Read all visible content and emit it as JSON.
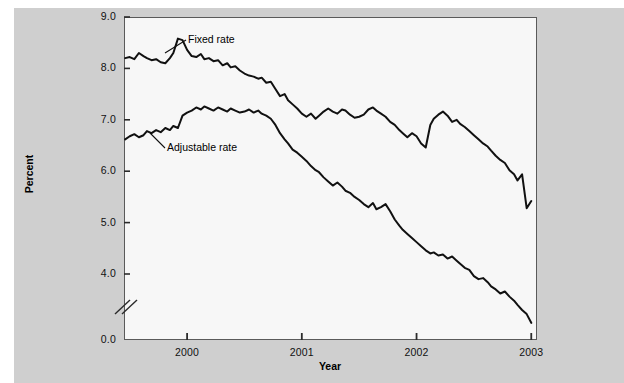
{
  "chart_data": {
    "type": "line",
    "title": "",
    "xlabel": "Year",
    "ylabel": "Percent",
    "grid": false,
    "legend_position": "inline-annotations",
    "xlim": [
      1999.45,
      2003.05
    ],
    "ylim": [
      3.85,
      9.0
    ],
    "y_axis_break": true,
    "y_axis_break_note": "axis broken between 4.0 and 0.0",
    "yticks": [
      "0.0",
      "4.0",
      "5.0",
      "6.0",
      "7.0",
      "8.0",
      "9.0"
    ],
    "ytick_values": [
      0.0,
      4.0,
      5.0,
      6.0,
      7.0,
      8.0,
      9.0
    ],
    "xticks": [
      "2000",
      "2001",
      "2002",
      "2003"
    ],
    "xtick_values": [
      2000,
      2001,
      2002,
      2003
    ],
    "annotations": [
      {
        "text": "Fixed rate",
        "x": 2000.08,
        "y": 8.72
      },
      {
        "text": "Adjustable rate",
        "x": 1999.95,
        "y": 6.56
      }
    ],
    "series": [
      {
        "name": "Fixed rate",
        "color": "#111111",
        "x": [
          1999.46,
          1999.5,
          1999.54,
          1999.58,
          1999.62,
          1999.65,
          1999.69,
          1999.73,
          1999.77,
          1999.81,
          1999.85,
          1999.88,
          1999.92,
          1999.96,
          2000.0,
          2000.04,
          2000.08,
          2000.12,
          2000.15,
          2000.19,
          2000.23,
          2000.27,
          2000.31,
          2000.35,
          2000.38,
          2000.42,
          2000.46,
          2000.5,
          2000.54,
          2000.58,
          2000.62,
          2000.65,
          2000.69,
          2000.73,
          2000.77,
          2000.81,
          2000.85,
          2000.88,
          2000.92,
          2000.96,
          2001.0,
          2001.04,
          2001.08,
          2001.12,
          2001.15,
          2001.19,
          2001.23,
          2001.27,
          2001.31,
          2001.35,
          2001.38,
          2001.42,
          2001.46,
          2001.5,
          2001.54,
          2001.58,
          2001.62,
          2001.65,
          2001.69,
          2001.73,
          2001.77,
          2001.81,
          2001.85,
          2001.88,
          2001.92,
          2001.96,
          2002.0,
          2002.04,
          2002.08,
          2002.12,
          2002.15,
          2002.19,
          2002.23,
          2002.27,
          2002.31,
          2002.35,
          2002.38,
          2002.42,
          2002.46,
          2002.5,
          2002.54,
          2002.58,
          2002.62,
          2002.65,
          2002.69,
          2002.73,
          2002.77,
          2002.81,
          2002.85,
          2002.88,
          2002.92,
          2002.96,
          2003.0
        ],
        "y": [
          8.2,
          8.22,
          8.18,
          8.3,
          8.24,
          8.2,
          8.16,
          8.18,
          8.12,
          8.1,
          8.2,
          8.3,
          8.58,
          8.55,
          8.36,
          8.24,
          8.22,
          8.28,
          8.18,
          8.2,
          8.14,
          8.16,
          8.06,
          8.1,
          8.02,
          8.04,
          7.96,
          7.9,
          7.86,
          7.84,
          7.8,
          7.82,
          7.72,
          7.74,
          7.6,
          7.46,
          7.5,
          7.38,
          7.3,
          7.22,
          7.12,
          7.06,
          7.12,
          7.02,
          7.08,
          7.16,
          7.22,
          7.16,
          7.12,
          7.2,
          7.18,
          7.1,
          7.04,
          7.06,
          7.1,
          7.2,
          7.24,
          7.18,
          7.12,
          7.06,
          6.96,
          6.9,
          6.8,
          6.74,
          6.66,
          6.74,
          6.68,
          6.54,
          6.46,
          6.9,
          7.02,
          7.1,
          7.16,
          7.08,
          6.96,
          7.0,
          6.92,
          6.86,
          6.78,
          6.7,
          6.62,
          6.54,
          6.48,
          6.4,
          6.3,
          6.22,
          6.16,
          6.02,
          5.94,
          5.82,
          5.94,
          5.28,
          5.42
        ]
      },
      {
        "name": "Adjustable rate",
        "color": "#111111",
        "x": [
          1999.46,
          1999.5,
          1999.54,
          1999.58,
          1999.62,
          1999.65,
          1999.69,
          1999.73,
          1999.77,
          1999.81,
          1999.85,
          1999.88,
          1999.92,
          1999.96,
          2000.0,
          2000.04,
          2000.08,
          2000.12,
          2000.15,
          2000.19,
          2000.23,
          2000.27,
          2000.31,
          2000.35,
          2000.38,
          2000.42,
          2000.46,
          2000.5,
          2000.54,
          2000.58,
          2000.62,
          2000.65,
          2000.69,
          2000.73,
          2000.77,
          2000.81,
          2000.85,
          2000.88,
          2000.92,
          2000.96,
          2001.0,
          2001.04,
          2001.08,
          2001.12,
          2001.15,
          2001.19,
          2001.23,
          2001.27,
          2001.31,
          2001.35,
          2001.38,
          2001.42,
          2001.46,
          2001.5,
          2001.54,
          2001.58,
          2001.62,
          2001.65,
          2001.69,
          2001.73,
          2001.77,
          2001.81,
          2001.85,
          2001.88,
          2001.92,
          2001.96,
          2002.0,
          2002.04,
          2002.08,
          2002.12,
          2002.15,
          2002.19,
          2002.23,
          2002.27,
          2002.31,
          2002.35,
          2002.38,
          2002.42,
          2002.46,
          2002.5,
          2002.54,
          2002.58,
          2002.62,
          2002.65,
          2002.69,
          2002.73,
          2002.77,
          2002.81,
          2002.85,
          2002.88,
          2002.92,
          2002.96,
          2003.0
        ],
        "y": [
          6.62,
          6.68,
          6.72,
          6.66,
          6.7,
          6.78,
          6.74,
          6.8,
          6.76,
          6.84,
          6.8,
          6.88,
          6.84,
          7.08,
          7.14,
          7.18,
          7.24,
          7.2,
          7.26,
          7.22,
          7.18,
          7.24,
          7.2,
          7.16,
          7.22,
          7.18,
          7.14,
          7.16,
          7.2,
          7.14,
          7.18,
          7.12,
          7.08,
          7.02,
          6.9,
          6.74,
          6.62,
          6.54,
          6.42,
          6.36,
          6.28,
          6.2,
          6.1,
          6.02,
          5.98,
          5.88,
          5.8,
          5.72,
          5.78,
          5.7,
          5.62,
          5.58,
          5.5,
          5.44,
          5.36,
          5.3,
          5.38,
          5.26,
          5.3,
          5.36,
          5.22,
          5.06,
          4.94,
          4.86,
          4.78,
          4.7,
          4.62,
          4.54,
          4.46,
          4.4,
          4.42,
          4.36,
          4.38,
          4.3,
          4.34,
          4.26,
          4.2,
          4.12,
          4.08,
          3.96,
          3.9,
          3.92,
          3.84,
          3.76,
          3.7,
          3.62,
          3.66,
          3.56,
          3.48,
          3.4,
          3.3,
          3.22,
          3.05
        ]
      }
    ]
  }
}
